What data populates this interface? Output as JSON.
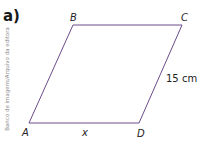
{
  "item_label": "a)",
  "credit": "Banco de imagens/Arquivo da editora",
  "figure": {
    "shape": "parallelogram",
    "stroke_color": "#6b4c8a",
    "vertices": [
      {
        "name": "A",
        "x": 29,
        "y": 123
      },
      {
        "name": "B",
        "x": 73,
        "y": 25
      },
      {
        "name": "C",
        "x": 182,
        "y": 25
      },
      {
        "name": "D",
        "x": 139,
        "y": 123
      }
    ],
    "labels": {
      "A": "A",
      "B": "B",
      "C": "C",
      "D": "D"
    },
    "measures": {
      "AD": "x",
      "CD": "15 cm"
    }
  }
}
